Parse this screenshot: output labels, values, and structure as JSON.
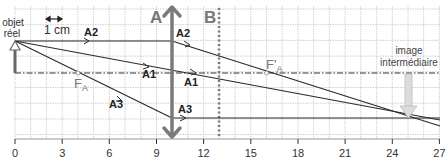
{
  "diagram": {
    "type": "optical-ray-diagram",
    "scale_label": "1 cm",
    "object_label_line1": "objet",
    "object_label_line2": "réel",
    "lens_a_label": "A",
    "lens_b_label": "B",
    "focal_object_label": "F",
    "focal_object_sub": "A",
    "focal_image_label": "F'",
    "focal_image_sub": "A",
    "image_label_line1": "image",
    "image_label_line2": "intermédiaire",
    "rays": {
      "a2_left": "A2",
      "a2_right": "A2",
      "a1_left": "A1",
      "a1_right": "A1",
      "a3_left": "A3",
      "a3_right": "A3"
    },
    "axis_ticks": [
      "0",
      "3",
      "6",
      "9",
      "12",
      "15",
      "18",
      "21",
      "24",
      "27"
    ],
    "positions_cm": {
      "object": 0,
      "focal_object_F_A": 4,
      "lens_A": 10,
      "lens_B": 13,
      "focal_image_F'_A": 16,
      "intermediate_image": 25
    },
    "colors": {
      "grid": "#bdbdbd",
      "rays": "#2b2b2b",
      "lens": "#7a7a7a",
      "image_arrow": "#d6d6d6"
    }
  }
}
